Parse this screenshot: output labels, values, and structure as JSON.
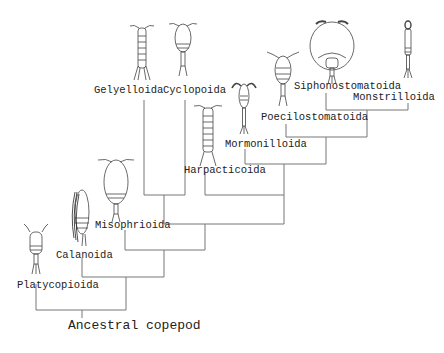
{
  "diagram": {
    "type": "phylogenetic-tree",
    "root": "Ancestral copepod",
    "line_color": "#777777",
    "taxa": [
      "Platycopioida",
      "Calanoida",
      "Misophrioida",
      "Gelyelloida",
      "Cyclopoida",
      "Harpacticoida",
      "Mormonilloida",
      "Poecilostomatoida",
      "Siphonostomatoida",
      "Monstrilloida"
    ],
    "labels": {
      "root": "Ancestral copepod",
      "platycopioida": "Platycopioida",
      "calanoida": "Calanoida",
      "misophrioida": "Misophrioida",
      "gelyelloida": "Gelyelloida",
      "cyclopoida": "Cyclopoida",
      "harpacticoida": "Harpacticoida",
      "mormonilloida": "Mormonilloida",
      "poecilostomatoida": "Poecilostomatoida",
      "siphonostomatoida": "Siphonostomatoida",
      "monstrilloida": "Monstrilloida"
    },
    "topology": "(Platycopioida,(Calanoida,(Misophrioida,((Gelyelloida,Cyclopoida),(Harpacticoida,(Mormonilloida,(Poecilostomatoida,(Siphonostomatoida,Monstrilloida))))))))"
  }
}
